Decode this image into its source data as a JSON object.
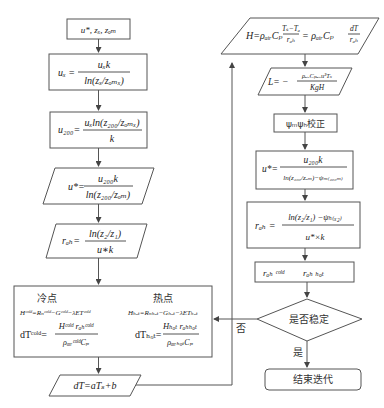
{
  "header_fragment": "………………………………………",
  "left_column": {
    "input_box": "u*, zₓ, zₒₘ",
    "ux_formula": {
      "lhs": "uₓ =",
      "num": "uₓk",
      "den": "ln(zₓ/zₒₘₓ)"
    },
    "u200_formula": {
      "lhs": "u₂₀₀=",
      "num": "uₓln(z₂₀₀/zₒₘₓ)",
      "den": "k"
    },
    "ustar_formula": {
      "lhs": "u*=",
      "num": "u₂₀₀k",
      "den": "ln(z₂₀₀/zₒₘ)"
    },
    "rah_formula": {
      "lhs": "rₐₕ=",
      "num": "ln(z₂/z₁)",
      "den": "u∗k"
    },
    "points_box": {
      "cold_title": "冷点",
      "hot_title": "热点",
      "cold_H": "Hᶜᵒˡᵈ=Rₙᶜᵒˡᵈ−Gᶜᵒˡᵈ−λETᶜᵒˡᵈ",
      "hot_H": "Hₕₒₜ=Rₙₕₒₜ−Gₕₒₜ−λETₕₒₜ",
      "cold_dT": {
        "lhs": "dTᶜᵒˡᵈ=",
        "num": "Hᶜᵒˡᵈ rₐₕᶜᵒˡᵈ",
        "den": "ρₐᵢᵣᶜᵒˡᵈCₚ"
      },
      "hot_dT": {
        "lhs": "dTₕₒₜ=",
        "num": "Hₕₒₜ rₐₕₕₒₜ",
        "den": "ρₐᵢᵣₕₒₜCₚ"
      }
    },
    "dT_linear": "dT=aTₛ+b"
  },
  "right_column": {
    "H_formula": {
      "lhs": "H=ρₐᵢᵣCₚ",
      "frac1_num": "Tₛ−Tₐ",
      "frac1_den": "rₐₕ",
      "mid": "= ρₐᵢᵣCₚ",
      "frac2_num": "dT",
      "frac2_den": "rₐₕ"
    },
    "L_formula": {
      "lhs": "L= −",
      "num": "ρₐᵢᵣCₚₐᵢᵣu³Tₛ",
      "den": "KgH"
    },
    "psi_correction": "ψₘψₕ校正",
    "ustar2_formula": {
      "lhs": "u*=",
      "num": "u₂₀₀k",
      "den": "ln(z₂₀₀/zₒₘ)−ψₘ₍₂₀₀ₘ₎"
    },
    "rah2_formula": {
      "lhs": "rₐₕ =",
      "num": "ln(z₂/z₁) −ψₕ₍ₓ₂₎",
      "den": "u*×k"
    },
    "rah_cold_hot": {
      "cold": "rₐₕ ᶜᵒˡᵈ",
      "hot": "rₐₕ ₕₒₜ"
    },
    "decision": "是否稳定",
    "no_label": "否",
    "yes_label": "是",
    "end_box": "结束迭代"
  }
}
